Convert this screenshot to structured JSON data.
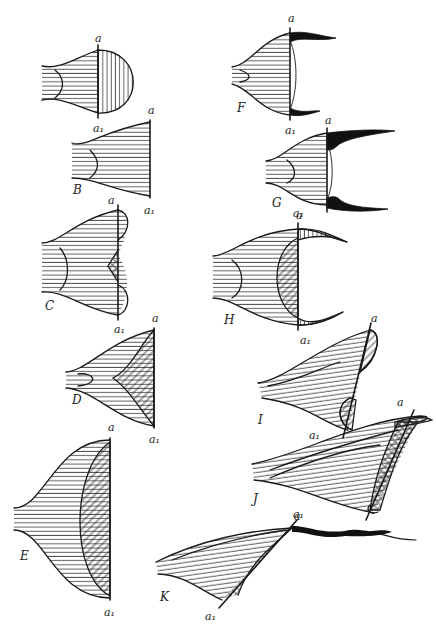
{
  "figure": {
    "colors": {
      "ink": "#1a1a1a",
      "paper": "#ffffff"
    },
    "axis_labels": {
      "top": "a",
      "bottom": "a₁"
    },
    "panels": [
      {
        "id": "A",
        "label": ""
      },
      {
        "id": "B",
        "label": "B"
      },
      {
        "id": "C",
        "label": "C"
      },
      {
        "id": "D",
        "label": "D"
      },
      {
        "id": "E",
        "label": "E"
      },
      {
        "id": "F",
        "label": "F"
      },
      {
        "id": "G",
        "label": "G"
      },
      {
        "id": "H",
        "label": "H"
      },
      {
        "id": "I",
        "label": "I"
      },
      {
        "id": "J",
        "label": "J"
      },
      {
        "id": "K",
        "label": "K"
      }
    ]
  }
}
